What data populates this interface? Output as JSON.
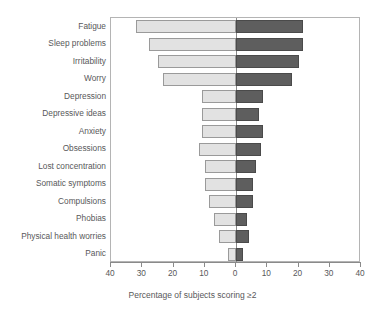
{
  "chart_data": {
    "type": "bar",
    "orientation": "horizontal",
    "layout": "diverging-pyramid",
    "title": "",
    "xlabel": "Percentage of subjects scoring ≥2",
    "ylabel": "",
    "xlim": [
      -40,
      40
    ],
    "xticks": [
      40,
      30,
      20,
      10,
      0,
      10,
      20,
      30,
      40
    ],
    "grid": false,
    "legend": "none",
    "colors": {
      "left_series": "#e2e2e2",
      "right_series": "#5e5e5e",
      "axis": "#8a8a8a",
      "frame": "#b4b4b4",
      "text": "#58585a"
    },
    "categories": [
      "Fatigue",
      "Sleep problems",
      "Irritability",
      "Worry",
      "Depression",
      "Depressive ideas",
      "Anxiety",
      "Obsessions",
      "Lost concentration",
      "Somatic symptoms",
      "Compulsions",
      "Phobias",
      "Physical health worries",
      "Panic"
    ],
    "series": [
      {
        "name": "left",
        "side": "left",
        "values": [
          32,
          28,
          25,
          23.5,
          11,
          11,
          11,
          12,
          10,
          10,
          8.5,
          7,
          5.5,
          2.5
        ]
      },
      {
        "name": "right",
        "side": "right",
        "values": [
          21.5,
          21.5,
          20,
          18,
          8.5,
          7.5,
          8.5,
          8,
          6.5,
          5.5,
          5.5,
          3.5,
          4,
          2.2
        ]
      }
    ],
    "tick_labels": [
      "40",
      "30",
      "20",
      "10",
      "0",
      "10",
      "20",
      "30",
      "40"
    ]
  }
}
